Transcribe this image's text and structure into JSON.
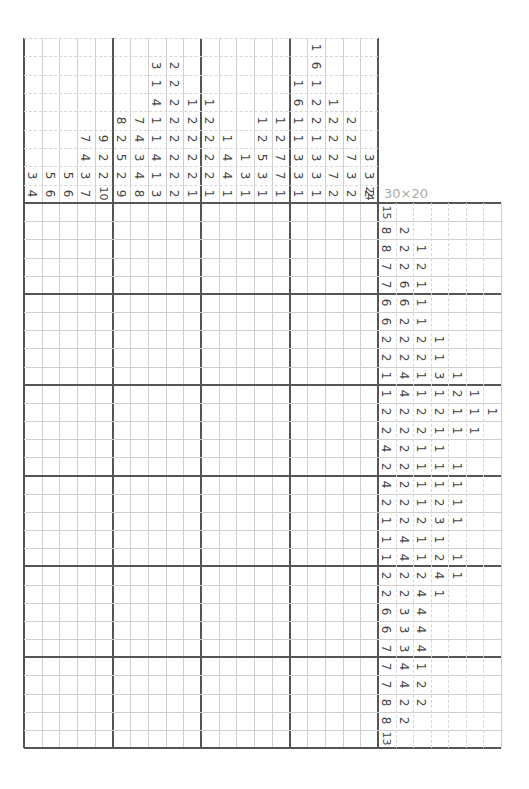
{
  "puzzle": {
    "size_label": "30×20",
    "corner_label": "24",
    "column_clues": [
      [
        3,
        4
      ],
      [
        5,
        6
      ],
      [
        5,
        6
      ],
      [
        7,
        4,
        3,
        7
      ],
      [
        9,
        2,
        2,
        10
      ],
      [
        8,
        2,
        5,
        2,
        9
      ],
      [
        7,
        4,
        3,
        4,
        8
      ],
      [
        3,
        1,
        4,
        1,
        1,
        4,
        1,
        3
      ],
      [
        2,
        2,
        2,
        2,
        2,
        2,
        2,
        2
      ],
      [
        1,
        2,
        2,
        2,
        2,
        1
      ],
      [
        1,
        2,
        2,
        2,
        2,
        1
      ],
      [
        1,
        4,
        4,
        1
      ],
      [
        1,
        3,
        1
      ],
      [
        1,
        2,
        5,
        3,
        1
      ],
      [
        1,
        2,
        7,
        7,
        1
      ],
      [
        1,
        6,
        1,
        1,
        3,
        3,
        1
      ],
      [
        1,
        6,
        1,
        2,
        2,
        1,
        3,
        3,
        1
      ],
      [
        1,
        2,
        2,
        2,
        7,
        2
      ],
      [
        2,
        2,
        7,
        3,
        2
      ],
      [
        3,
        3,
        2
      ]
    ],
    "row_clues": [
      [
        15
      ],
      [
        8,
        2
      ],
      [
        8,
        2,
        1
      ],
      [
        7,
        2,
        2
      ],
      [
        7,
        6,
        1
      ],
      [
        6,
        6,
        1
      ],
      [
        6,
        2,
        1
      ],
      [
        2,
        2,
        2,
        1
      ],
      [
        2,
        2,
        2,
        1
      ],
      [
        1,
        4,
        1,
        3,
        1
      ],
      [
        1,
        4,
        1,
        1,
        2,
        1
      ],
      [
        2,
        2,
        2,
        2,
        1,
        1,
        1
      ],
      [
        2,
        2,
        2,
        1,
        1,
        1
      ],
      [
        4,
        2,
        1,
        1
      ],
      [
        2,
        2,
        1,
        1,
        1
      ],
      [
        4,
        2,
        1,
        1,
        1
      ],
      [
        2,
        2,
        1,
        2,
        1
      ],
      [
        1,
        2,
        2,
        3,
        1
      ],
      [
        1,
        4,
        1,
        1
      ],
      [
        1,
        4,
        1,
        2,
        1
      ],
      [
        2,
        2,
        2,
        4,
        1
      ],
      [
        2,
        2,
        4,
        1
      ],
      [
        6,
        3,
        4
      ],
      [
        6,
        3,
        4
      ],
      [
        7,
        3,
        4
      ],
      [
        7,
        4,
        1
      ],
      [
        7,
        4,
        2
      ],
      [
        8,
        2,
        2
      ],
      [
        8,
        2
      ],
      [
        13
      ]
    ]
  }
}
